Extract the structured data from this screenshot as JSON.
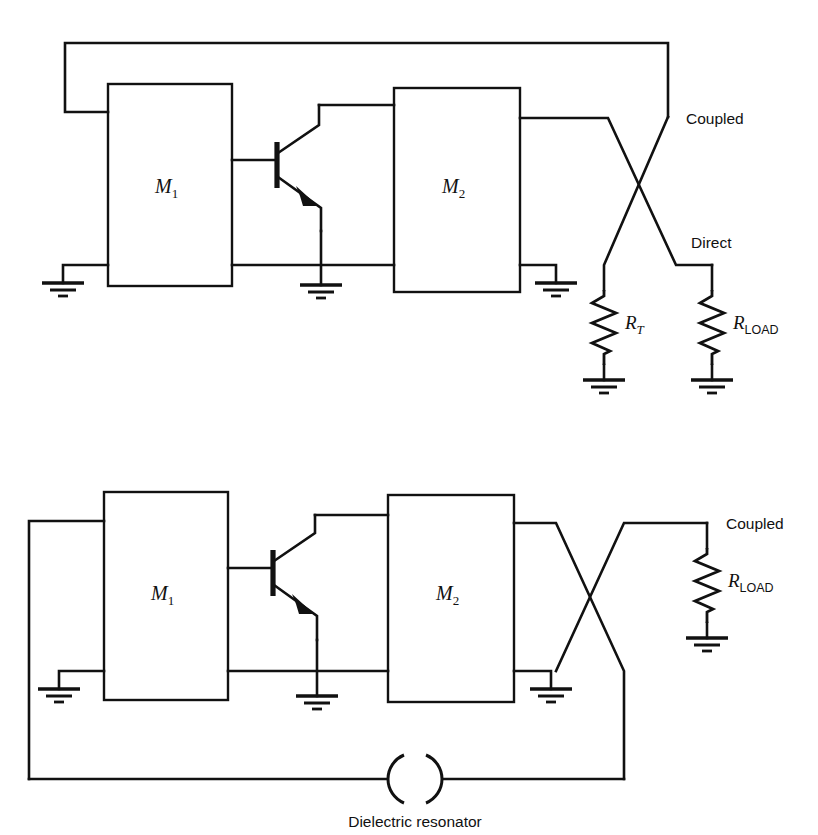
{
  "figure": {
    "kind": "circuit-schematic",
    "line_color": "#111111",
    "background_color": "#ffffff"
  },
  "circuits": [
    {
      "id": "top-circuit",
      "name": "feedback-oscillator-with-termination",
      "blocks": [
        {
          "id": "m1",
          "label": "M",
          "sub": "1"
        },
        {
          "id": "m2",
          "label": "M",
          "sub": "2"
        }
      ],
      "device": {
        "id": "q1",
        "type": "npn-transistor"
      },
      "port_labels": [
        {
          "id": "coupled",
          "text": "Coupled"
        },
        {
          "id": "direct",
          "text": "Direct"
        }
      ],
      "resistors": [
        {
          "id": "rt",
          "label": "R",
          "sub": "T",
          "sub_style": "italic"
        },
        {
          "id": "rload",
          "label": "R",
          "sub": "LOAD",
          "sub_style": "upright"
        }
      ],
      "ground_count": 5
    },
    {
      "id": "bottom-circuit",
      "name": "dielectric-resonator-oscillator",
      "blocks": [
        {
          "id": "m1",
          "label": "M",
          "sub": "1"
        },
        {
          "id": "m2",
          "label": "M",
          "sub": "2"
        }
      ],
      "device": {
        "id": "q1",
        "type": "npn-transistor"
      },
      "port_labels": [
        {
          "id": "coupled",
          "text": "Coupled"
        }
      ],
      "resistors": [
        {
          "id": "rload",
          "label": "R",
          "sub": "LOAD",
          "sub_style": "upright"
        }
      ],
      "resonator": {
        "id": "dielectric-resonator",
        "caption": "Dielectric resonator"
      },
      "ground_count": 4
    }
  ]
}
